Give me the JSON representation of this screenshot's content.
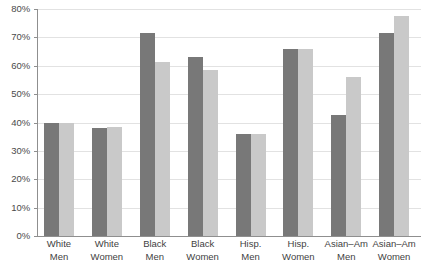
{
  "chart_data": {
    "type": "bar",
    "title": "",
    "subtitle": "",
    "xlabel": "",
    "ylabel": "",
    "ylim": [
      0,
      80
    ],
    "ytick_values": [
      0,
      10,
      20,
      30,
      40,
      50,
      60,
      70,
      80
    ],
    "ytick_labels": [
      "0%",
      "10%",
      "20%",
      "30%",
      "40%",
      "50%",
      "60%",
      "70%",
      "80%"
    ],
    "grid": true,
    "legend": false,
    "legend_position": "none",
    "categories": [
      "White Men",
      "White Women",
      "Black Men",
      "Black Women",
      "Hisp. Men",
      "Hisp. Women",
      "Asian–Am Men",
      "Asian–Am Women"
    ],
    "category_lines": [
      {
        "line1": "White",
        "line2": "Men"
      },
      {
        "line1": "White",
        "line2": "Women"
      },
      {
        "line1": "Black",
        "line2": "Men"
      },
      {
        "line1": "Black",
        "line2": "Women"
      },
      {
        "line1": "Hisp.",
        "line2": "Men"
      },
      {
        "line1": "Hisp.",
        "line2": "Women"
      },
      {
        "line1": "Asian–Am",
        "line2": "Men"
      },
      {
        "line1": "Asian–Am",
        "line2": "Women"
      }
    ],
    "series": [
      {
        "name": "Series 1",
        "color": "#787878",
        "values": [
          40,
          38,
          71.5,
          63,
          36,
          66,
          42.5,
          71.5
        ]
      },
      {
        "name": "Series 2",
        "color": "#c9c9c9",
        "values": [
          40,
          38.5,
          61.5,
          58.5,
          36,
          66,
          56,
          77.5
        ]
      }
    ]
  },
  "colors": {
    "series_a": "#787878",
    "series_b": "#c9c9c9",
    "axis": "#8f8f8f",
    "gridline": "#e2e2e2",
    "text": "#3f3f3f",
    "background": "#ffffff"
  }
}
